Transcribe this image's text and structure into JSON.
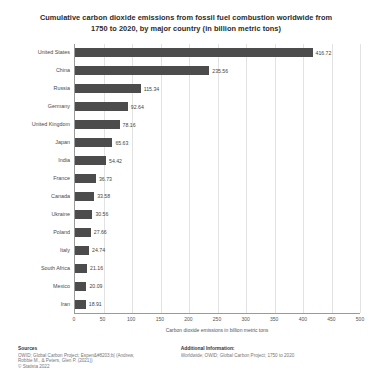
{
  "chart_data": {
    "type": "bar",
    "orientation": "horizontal",
    "title": "Cumulative carbon dioxide emissions from fossil fuel combustion worldwide from 1750 to 2020, by major country (in billion metric tons)",
    "title_lines": [
      "Cumulative carbon dioxide emissions from fossil fuel combustion worldwide from",
      "1750 to 2020, by major country (in billion metric tons)"
    ],
    "categories": [
      "United States",
      "China",
      "Russia",
      "Germany",
      "United Kingdom",
      "Japan",
      "India",
      "France",
      "Canada",
      "Ukraine",
      "Poland",
      "Italy",
      "South Africa",
      "Mexico",
      "Iran"
    ],
    "values": [
      416.72,
      235.56,
      115.34,
      92.64,
      78.16,
      65.63,
      54.42,
      36.73,
      33.58,
      30.56,
      27.66,
      24.74,
      21.16,
      20.09,
      18.91
    ],
    "value_labels": [
      "416.72",
      "235.56",
      "115.34",
      "92.64",
      "78.16",
      "65.63",
      "54.42",
      "36.73",
      "33.58",
      "30.56",
      "27.66",
      "24.74",
      "21.16",
      "20.09",
      "18.91"
    ],
    "xlabel": "Carbon dioxide emissions in billion metric tons",
    "ylabel": "",
    "xlim": [
      0,
      500
    ],
    "xticks": [
      0,
      50,
      100,
      150,
      200,
      250,
      300,
      350,
      400,
      450,
      500
    ],
    "xtick_labels": [
      "0",
      "50",
      "100",
      "150",
      "200",
      "250",
      "300",
      "350",
      "400",
      "450",
      "500"
    ],
    "grid": true,
    "legend": false,
    "bar_color": "#4c4c4c",
    "background_color": "#ffffff"
  },
  "footer": {
    "sources_heading": "Sources",
    "sources_lines": [
      "OWID; Global Carbon Project; Espen&#8203;b| (Andrew,",
      "Robbie M., & Peters, Glen P. (2021))",
      "© Statista 2022"
    ],
    "additional_heading": "Additional Information:",
    "additional_lines": [
      "Worldwide; OWID; Global Carbon Project; 1750 to 2020"
    ]
  }
}
